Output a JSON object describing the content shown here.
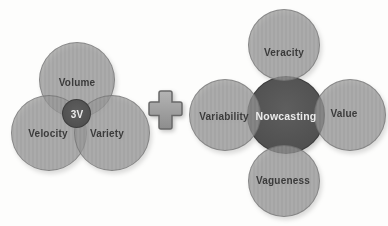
{
  "left_diagram": {
    "center_label": "3V",
    "circles": [
      {
        "id": "volume",
        "label": "Volume"
      },
      {
        "id": "velocity",
        "label": "Velocity"
      },
      {
        "id": "variety",
        "label": "Variety"
      }
    ]
  },
  "plus": {
    "icon": "plus-icon",
    "glyph": "+"
  },
  "right_diagram": {
    "center_label": "Nowcasting",
    "circles": [
      {
        "id": "veracity",
        "label": "Veracity"
      },
      {
        "id": "variability",
        "label": "Variability"
      },
      {
        "id": "value",
        "label": "Value"
      },
      {
        "id": "vagueness",
        "label": "Vagueness"
      }
    ]
  },
  "colors": {
    "background": "#fdfdfc",
    "light_circle_fill": "#b2b2b2",
    "circle_overlap_fill": "#a0a0a0",
    "dark_circle_fill": "#545454",
    "label_text": "#3b3b3b",
    "center_label_text": "#ebebeb",
    "plus_fill": "#9b9b9b",
    "plus_outline": "#686868"
  }
}
